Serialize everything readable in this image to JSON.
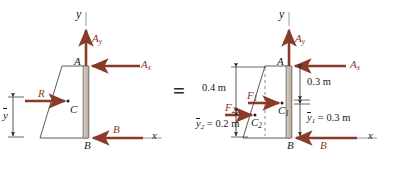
{
  "figure": {
    "type": "free-body-diagram",
    "operator": "=",
    "colors": {
      "force_arrow": "#8a3a28",
      "outline": "#4a4a4a",
      "column_fill": "#c9bfb4",
      "axis": "#9a9a9a",
      "text": "#1a1a1a"
    }
  },
  "left_diagram": {
    "name": "resultant-force-body",
    "axes": {
      "y_label": "y",
      "x_label": "x"
    },
    "points": {
      "A": "A",
      "B": "B",
      "C": "C"
    },
    "forces": [
      {
        "id": "Ay",
        "base": "A",
        "sub": "y",
        "direction": "up",
        "at": "A"
      },
      {
        "id": "Ax",
        "base": "A",
        "sub": "x",
        "direction": "left",
        "at": "A"
      },
      {
        "id": "B",
        "base": "B",
        "sub": "",
        "direction": "left",
        "at": "B"
      },
      {
        "id": "R",
        "base": "R",
        "sub": "",
        "direction": "right",
        "at": "C"
      }
    ],
    "dimensions": [
      {
        "id": "ybar",
        "base": "y",
        "sub": "",
        "text": "",
        "overbar": true
      }
    ]
  },
  "right_diagram": {
    "name": "component-force-body",
    "axes": {
      "y_label": "y",
      "x_label": "x"
    },
    "points": {
      "A": "A",
      "B": "B",
      "C1": "C",
      "C1_sub": "1",
      "C2": "C",
      "C2_sub": "2"
    },
    "forces": [
      {
        "id": "Ay",
        "base": "A",
        "sub": "y",
        "direction": "up",
        "at": "A"
      },
      {
        "id": "Ax",
        "base": "A",
        "sub": "x",
        "direction": "left",
        "at": "A"
      },
      {
        "id": "B",
        "base": "B",
        "sub": "",
        "direction": "left",
        "at": "B"
      },
      {
        "id": "F1",
        "base": "F",
        "sub": "1",
        "direction": "right",
        "at": "C1"
      },
      {
        "id": "F2",
        "base": "F",
        "sub": "2",
        "direction": "right",
        "at": "C2"
      }
    ],
    "dimensions": [
      {
        "id": "d04",
        "text": "0.4 m",
        "side": "left"
      },
      {
        "id": "y2",
        "base": "y",
        "sub": "2",
        "text": "= 0.2 m",
        "overbar": true,
        "side": "left"
      },
      {
        "id": "d03",
        "text": "0.3 m",
        "side": "right"
      },
      {
        "id": "y1",
        "base": "y",
        "sub": "1",
        "text": "= 0.3 m",
        "overbar": true,
        "side": "right"
      }
    ]
  }
}
